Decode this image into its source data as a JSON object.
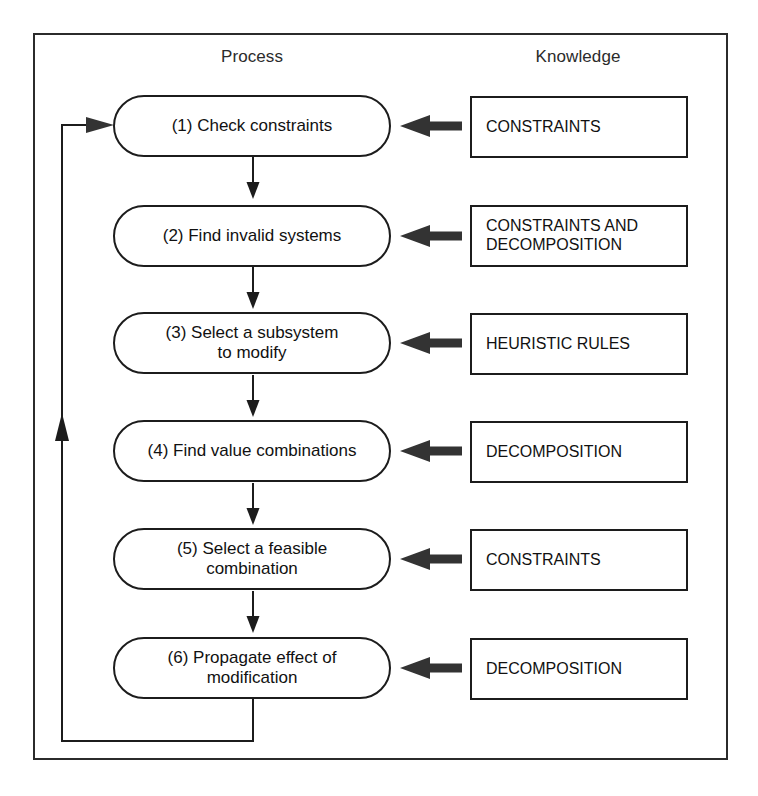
{
  "figure": {
    "headers": {
      "process": "Process",
      "knowledge": "Knowledge"
    },
    "colors": {
      "stroke": "#1c1c1c",
      "frame": "#2b2b2b",
      "arrow_fill": "#333333",
      "background": "#ffffff"
    },
    "process_steps": [
      {
        "id": 1,
        "label": "(1)  Check constraints"
      },
      {
        "id": 2,
        "label": "(2)  Find invalid systems"
      },
      {
        "id": 3,
        "label": "(3)  Select  a subsystem\nto modify"
      },
      {
        "id": 4,
        "label": "(4)  Find value combinations"
      },
      {
        "id": 5,
        "label": "(5)  Select  a feasible\ncombination"
      },
      {
        "id": 6,
        "label": "(6)  Propagate effect of\nmodification"
      }
    ],
    "knowledge_items": [
      {
        "id": 1,
        "label": "CONSTRAINTS"
      },
      {
        "id": 2,
        "label": "CONSTRAINTS AND\nDECOMPOSITION"
      },
      {
        "id": 3,
        "label": "HEURISTIC RULES"
      },
      {
        "id": 4,
        "label": "DECOMPOSITION"
      },
      {
        "id": 5,
        "label": "CONSTRAINTS"
      },
      {
        "id": 6,
        "label": "DECOMPOSITION"
      }
    ],
    "connector_arrows": [
      {
        "from": "knowledge-1",
        "to": "process-1",
        "direction": "left"
      },
      {
        "from": "knowledge-2",
        "to": "process-2",
        "direction": "left"
      },
      {
        "from": "knowledge-3",
        "to": "process-3",
        "direction": "left"
      },
      {
        "from": "knowledge-4",
        "to": "process-4",
        "direction": "left"
      },
      {
        "from": "knowledge-5",
        "to": "process-5",
        "direction": "left"
      },
      {
        "from": "knowledge-6",
        "to": "process-6",
        "direction": "left"
      }
    ],
    "flow_arrows": [
      {
        "from": "process-1",
        "to": "process-2",
        "direction": "down"
      },
      {
        "from": "process-2",
        "to": "process-3",
        "direction": "down"
      },
      {
        "from": "process-3",
        "to": "process-4",
        "direction": "down"
      },
      {
        "from": "process-4",
        "to": "process-5",
        "direction": "down"
      },
      {
        "from": "process-5",
        "to": "process-6",
        "direction": "down"
      }
    ],
    "feedback_loop": {
      "from": "process-6",
      "to": "process-1",
      "direction": "up-then-right",
      "midpoint_arrow": "up"
    }
  }
}
